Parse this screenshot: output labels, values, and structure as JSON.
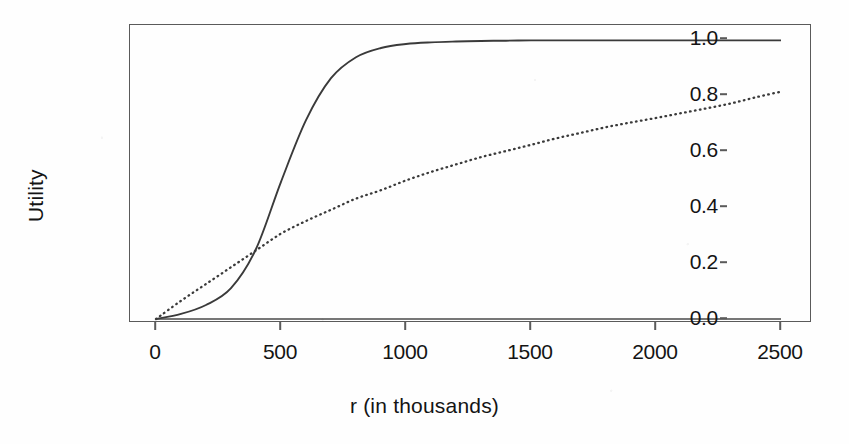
{
  "chart_data": {
    "type": "line",
    "title": "",
    "xlabel": "r (in thousands)",
    "ylabel": "Utility",
    "xlim": [
      0,
      2500
    ],
    "ylim": [
      0.0,
      1.0
    ],
    "grid": false,
    "legend": "none",
    "xticks": [
      0,
      500,
      1000,
      1500,
      2000,
      2500
    ],
    "xtick_labels": [
      "0",
      "500",
      "1000",
      "1500",
      "2000",
      "2500"
    ],
    "yticks": [
      0.0,
      0.2,
      0.4,
      0.6,
      0.8,
      1.0
    ],
    "ytick_labels": [
      "0.0",
      "0.2",
      "0.4",
      "0.6",
      "0.8",
      "1.0"
    ],
    "x": [
      0,
      100,
      200,
      300,
      400,
      500,
      600,
      700,
      800,
      900,
      1000,
      1100,
      1200,
      1300,
      1400,
      1500,
      1600,
      1700,
      1800,
      1900,
      2000,
      2100,
      2200,
      2300,
      2400,
      2500
    ],
    "series": [
      {
        "name": "solid-curve",
        "style": "solid",
        "color": "#3a3a3a",
        "values": [
          0.0,
          0.018,
          0.05,
          0.11,
          0.25,
          0.49,
          0.71,
          0.86,
          0.935,
          0.968,
          0.982,
          0.988,
          0.991,
          0.993,
          0.994,
          0.995,
          0.995,
          0.995,
          0.995,
          0.995,
          0.995,
          0.995,
          0.995,
          0.995,
          0.995,
          0.995
        ]
      },
      {
        "name": "dotted-curve",
        "style": "dotted",
        "color": "#3a3a3a",
        "values": [
          0.0,
          0.065,
          0.125,
          0.185,
          0.245,
          0.305,
          0.35,
          0.39,
          0.43,
          0.46,
          0.495,
          0.525,
          0.552,
          0.578,
          0.6,
          0.622,
          0.645,
          0.665,
          0.685,
          0.702,
          0.718,
          0.735,
          0.752,
          0.77,
          0.792,
          0.812
        ]
      },
      {
        "name": "baseline-zero",
        "style": "solid",
        "color": "#4a4a4a",
        "values": [
          0,
          0,
          0,
          0,
          0,
          0,
          0,
          0,
          0,
          0,
          0,
          0,
          0,
          0,
          0,
          0,
          0,
          0,
          0,
          0,
          0,
          0,
          0,
          0,
          0,
          0
        ]
      }
    ]
  }
}
